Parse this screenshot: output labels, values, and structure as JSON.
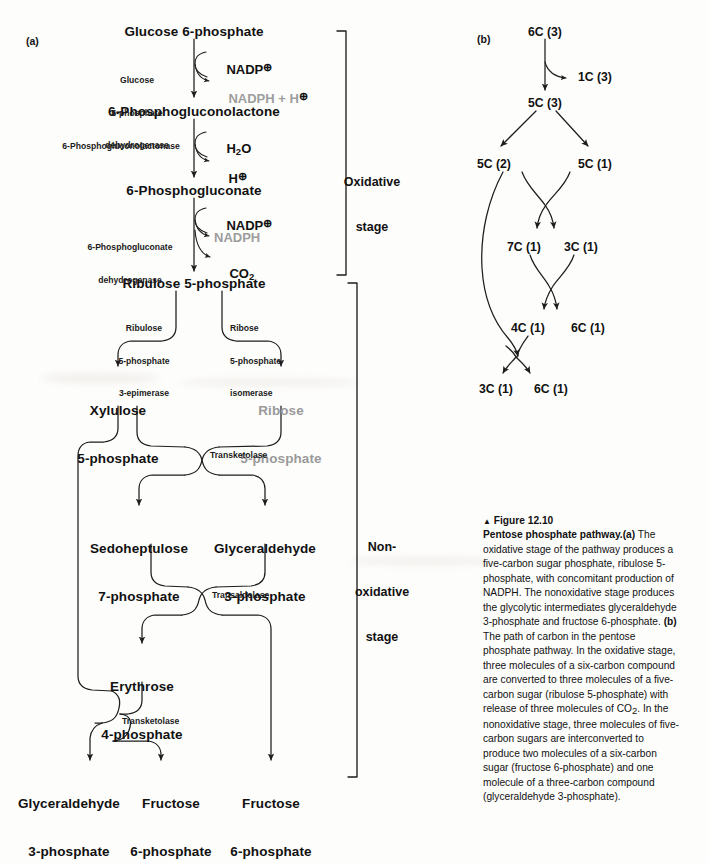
{
  "figure": {
    "marker": "▲",
    "number": "Figure 12.10",
    "title": "Pentose phosphate pathway.",
    "caption_a_label": "(a)",
    "caption_a": " The oxidative stage of the pathway produces a five-carbon sugar phosphate, ribulose 5-phosphate, with concomitant production of NADPH. The nonoxidative stage produces the glycolytic intermediates glyceraldehyde 3-phosphate and fructose 6-phosphate. ",
    "caption_b_label": "(b)",
    "caption_b": " The path of carbon in the pentose phosphate pathway. In the oxidative stage, three molecules of a six-carbon compound are converted to three molecules of a five-carbon sugar (ribulose 5-phosphate) with release of three molecules of CO",
    "caption_b_sub": "2",
    "caption_b_cont": ". In the nonoxidative stage, three molecules of five-carbon sugars are interconverted to produce two molecules of a six-carbon sugar (fructose 6-phosphate) and one molecule of a three-carbon compound (glyceraldehyde 3-phosphate)."
  },
  "panel_a": {
    "label": "(a)",
    "metabolites": {
      "g6p": "Glucose 6-phosphate",
      "pgl": "6-Phosphogluconolactone",
      "pg": "6-Phosphogluconate",
      "ru5p": "Ribulose 5-phosphate",
      "xu5p_l1": "Xylulose",
      "xu5p_l2": "5-phosphate",
      "r5p_l1": "Ribose",
      "r5p_l2": "5-phosphate",
      "s7p_l1": "Sedoheptulose",
      "s7p_l2": "7-phosphate",
      "gap_mid_l1": "Glyceraldehyde",
      "gap_mid_l2": "3-phosphate",
      "e4p_l1": "Erythrose",
      "e4p_l2": "4-phosphate",
      "gap_out_l1": "Glyceraldehyde",
      "gap_out_l2": "3-phosphate",
      "f6p_mid_l1": "Fructose",
      "f6p_mid_l2": "6-phosphate",
      "f6p_right_l1": "Fructose",
      "f6p_right_l2": "6-phosphate"
    },
    "enzymes": {
      "g6pdh_l1": "Glucose",
      "g6pdh_l2": "6-phosphate",
      "g6pdh_l3": "dehydrogenase",
      "lactonase": "6-Phosphogluconolactonase",
      "pgdh_l1": "6-Phosphogluconate",
      "pgdh_l2": "dehydrogenase",
      "epimerase_l1": "Ribulose",
      "epimerase_l2": "5-phosphate",
      "epimerase_l3": "3-epimerase",
      "isomerase_l1": "Ribose",
      "isomerase_l2": "5-phosphate",
      "isomerase_l3": "isomerase",
      "transketolase_1": "Transketolase",
      "transaldolase": "Transaldolase",
      "transketolase_2": "Transketolase"
    },
    "cofactors": {
      "nadp_plus_1": "NADP",
      "nadph_h": "NADPH + H",
      "water": "H",
      "water_sub": "2",
      "water_o": "O",
      "proton": "H",
      "nadp_plus_2": "NADP",
      "nadph": "NADPH",
      "co2": "CO",
      "co2_sub": "2",
      "plus_circle": "⊕"
    },
    "stages": {
      "oxidative_l1": "Oxidative",
      "oxidative_l2": "stage",
      "nonoxidative_l1": "Non-",
      "nonoxidative_l2": "oxidative",
      "nonoxidative_l3": "stage"
    }
  },
  "panel_b": {
    "label": "(b)",
    "nodes": {
      "n6c3": "6C (3)",
      "n1c3": "1C (3)",
      "n5c3": "5C (3)",
      "n5c2": "5C (2)",
      "n5c1": "5C (1)",
      "n7c1": "7C (1)",
      "n3c1_mid": "3C (1)",
      "n4c1": "4C (1)",
      "n6c1_mid": "6C (1)",
      "n3c1_bot": "3C (1)",
      "n6c1_bot": "6C (1)"
    }
  },
  "colors": {
    "ink": "#111111",
    "gray_text": "#9a9a9a",
    "line": "#1d1d1d",
    "background": "#fdfdfc"
  }
}
